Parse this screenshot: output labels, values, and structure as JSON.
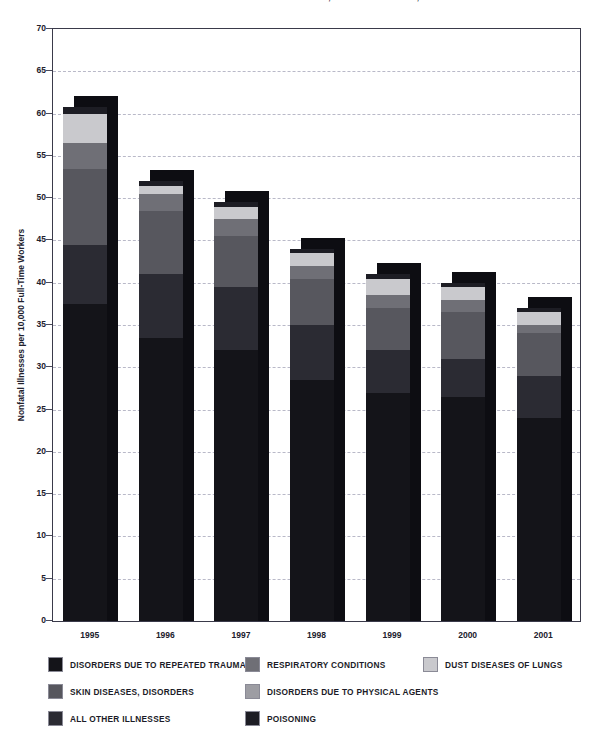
{
  "title": "NONFATAL OCCUPATIONAL ILLNESS INCIDENCE RATES BY CATEGORY, PRIVATE INDUSTRY, 1995-2001",
  "axis": {
    "y_title": "Nonfatal Illnesses per 10,000 Full-Time Workers",
    "y_ticks": [
      "70",
      "65",
      "60",
      "55",
      "50",
      "45",
      "40",
      "35",
      "30",
      "25",
      "20",
      "15",
      "10",
      "5",
      "0"
    ]
  },
  "legend": {
    "items": [
      {
        "label": "DISORDERS DUE TO REPEATED TRAUMA",
        "color": "#141419"
      },
      {
        "label": "RESPIRATORY CONDITIONS",
        "color": "#6f6f76"
      },
      {
        "label": "DUST DISEASES OF LUNGS",
        "color": "#c9c9cd"
      },
      {
        "label": "SKIN DISEASES, DISORDERS",
        "color": "#57575e"
      },
      {
        "label": "DISORDERS DUE TO PHYSICAL AGENTS",
        "color": "#9d9da3"
      },
      {
        "label": "ALL OTHER ILLNESSES",
        "color": "#2b2b33"
      },
      {
        "label": "POISONING",
        "color": "#1d1d24"
      }
    ]
  },
  "chart_data": {
    "type": "bar",
    "subtype": "stacked-column-3d",
    "title": "NONFATAL OCCUPATIONAL ILLNESS INCIDENCE RATES BY CATEGORY, PRIVATE INDUSTRY, 1995-2001",
    "xlabel": "",
    "ylabel": "Nonfatal Illnesses per 10,000 Full-Time Workers",
    "ylim": [
      0,
      70
    ],
    "ytick_step": 5,
    "grid": true,
    "legend_position": "bottom",
    "categories": [
      "1995",
      "1996",
      "1997",
      "1998",
      "1999",
      "2000",
      "2001"
    ],
    "series": [
      {
        "name": "DISORDERS DUE TO REPEATED TRAUMA",
        "color": "#141419",
        "values": [
          37.5,
          33.5,
          32.0,
          28.5,
          27.0,
          26.5,
          24.0
        ]
      },
      {
        "name": "ALL OTHER ILLNESSES",
        "color": "#2b2b33",
        "values": [
          7.0,
          7.5,
          7.5,
          6.5,
          5.0,
          4.5,
          5.0
        ]
      },
      {
        "name": "SKIN DISEASES, DISORDERS",
        "color": "#57575e",
        "values": [
          9.0,
          7.5,
          6.0,
          5.5,
          5.0,
          5.5,
          5.0
        ]
      },
      {
        "name": "RESPIRATORY CONDITIONS",
        "color": "#6f6f76",
        "values": [
          3.0,
          2.0,
          2.0,
          1.5,
          1.5,
          1.5,
          1.0
        ]
      },
      {
        "name": "DUST DISEASES OF LUNGS",
        "color": "#c9c9cd",
        "values": [
          3.5,
          1.0,
          1.5,
          1.5,
          2.0,
          1.5,
          1.5
        ]
      },
      {
        "name": "POISONING",
        "color": "#1d1d24",
        "values": [
          0.8,
          0.5,
          0.5,
          0.5,
          0.5,
          0.5,
          0.5
        ]
      }
    ],
    "totals": [
      60.8,
      52.0,
      49.5,
      44.0,
      41.0,
      40.0,
      37.0
    ]
  }
}
